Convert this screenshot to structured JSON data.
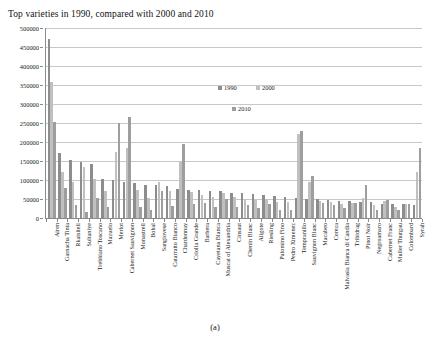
{
  "figure": {
    "caption": "(a)"
  },
  "chart_data": {
    "type": "bar",
    "title": "Top varieties in 1990, compared with 2000 and 2010",
    "xlabel": "",
    "ylabel": "",
    "ylim": [
      0,
      500000
    ],
    "ytick_step": 50000,
    "yticks": [
      500000,
      450000,
      400000,
      350000,
      300000,
      250000,
      200000,
      150000,
      100000,
      50000,
      0
    ],
    "ytick_labels": [
      "500000",
      "450000",
      "400000",
      "350000",
      "300000",
      "250000",
      "200000",
      "150000",
      "100000",
      "50000",
      "0"
    ],
    "grid": true,
    "grid_axis": "y",
    "legend": [
      "1990",
      "2000",
      "2010"
    ],
    "legend_position": "upper-center",
    "colors": {
      "1990": "#8d8d8d",
      "2000": "#c0c0c0",
      "2010": "#9e9e9e",
      "gridline": "#c8c8c8",
      "axis": "#8a8a8a"
    },
    "categories": [
      "Airen",
      "Garnacha Tinta",
      "Rkatsiteli",
      "Sultaniye",
      "Trebbiano Toscano",
      "Mazuelo",
      "Merlot",
      "Cabernet Sauvignon",
      "Monastrell",
      "Bobal",
      "Sangiovese",
      "Catarratto Bianco",
      "Chardonnay",
      "Criolla Grande",
      "Barbera",
      "Cayetana Blanca",
      "Muscat of Alexandria",
      "Cinsaut",
      "Chenin Blanc",
      "Aligote",
      "Riesling",
      "Palomino Fino",
      "Pedro Ximenez",
      "Tempranillo",
      "Sauvignon Blanc",
      "Macabeo",
      "Cereza",
      "Malvasia Bianca di Candia",
      "Tribidrag",
      "Pinot Noir",
      "Negroamaro",
      "Cabernet Franc",
      "Muller Thurgau",
      "Colombard",
      "Syrah"
    ],
    "series": [
      {
        "name": "1990",
        "values": [
          470000,
          170000,
          152000,
          148000,
          142000,
          103000,
          100000,
          94000,
          93000,
          88000,
          86000,
          85000,
          77000,
          74000,
          73000,
          71000,
          70000,
          67000,
          66000,
          63000,
          60000,
          57000,
          56000,
          53000,
          51000,
          50000,
          48000,
          45000,
          44000,
          42000,
          41000,
          38000,
          37000,
          36000,
          35000
        ]
      },
      {
        "name": "2000",
        "values": [
          358000,
          120000,
          95000,
          135000,
          103000,
          70000,
          175000,
          185000,
          75000,
          52000,
          95000,
          70000,
          148000,
          68000,
          60000,
          56000,
          65000,
          55000,
          51000,
          48000,
          50000,
          43000,
          42000,
          220000,
          95000,
          45000,
          42000,
          38000,
          40000,
          52000,
          34000,
          45000,
          30000,
          38000,
          120000
        ]
      },
      {
        "name": "2010",
        "values": [
          252000,
          80000,
          34000,
          15000,
          53000,
          28000,
          250000,
          265000,
          30000,
          22000,
          72000,
          32000,
          196000,
          38000,
          40000,
          30000,
          50000,
          29000,
          35000,
          26000,
          36000,
          21000,
          20000,
          230000,
          110000,
          39000,
          35000,
          26000,
          40000,
          86000,
          22000,
          48000,
          22000,
          36000,
          185000
        ]
      }
    ]
  }
}
